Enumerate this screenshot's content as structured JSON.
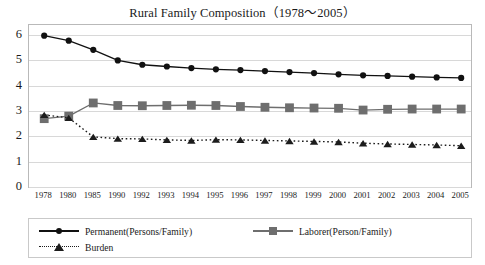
{
  "chart_data": {
    "type": "line",
    "title": "Rural Family Composition（1978～2005）",
    "xlabel": "",
    "ylabel": "",
    "ylim": [
      0,
      6.4
    ],
    "yticks": [
      0,
      1,
      2,
      3,
      4,
      5,
      6
    ],
    "grid": true,
    "legend_position": "bottom",
    "categories": [
      "1978",
      "1980",
      "1985",
      "1990",
      "1992",
      "1993",
      "1994",
      "1995",
      "1996",
      "1997",
      "1998",
      "1999",
      "2000",
      "2001",
      "2002",
      "2003",
      "2004",
      "2005"
    ],
    "series": [
      {
        "name": "Permanent(Persons/Family)",
        "marker": "circle",
        "line": "solid",
        "color": "#111111",
        "values": [
          5.98,
          5.78,
          5.42,
          5.0,
          4.83,
          4.76,
          4.7,
          4.65,
          4.62,
          4.58,
          4.54,
          4.5,
          4.45,
          4.41,
          4.39,
          4.36,
          4.33,
          4.31
        ]
      },
      {
        "name": "Laborer(Person/Family)",
        "marker": "square",
        "line": "solid",
        "color": "#6e6e6e",
        "values": [
          2.7,
          2.8,
          3.32,
          3.22,
          3.21,
          3.22,
          3.23,
          3.22,
          3.18,
          3.15,
          3.13,
          3.12,
          3.11,
          3.04,
          3.07,
          3.08,
          3.08,
          3.08
        ]
      },
      {
        "name": "Burden",
        "marker": "triangle",
        "line": "dotted",
        "color": "#1c1c1c",
        "values": [
          2.85,
          2.73,
          1.98,
          1.91,
          1.9,
          1.86,
          1.84,
          1.87,
          1.86,
          1.84,
          1.82,
          1.8,
          1.78,
          1.73,
          1.7,
          1.68,
          1.66,
          1.63
        ]
      }
    ]
  },
  "legend": {
    "entries": [
      {
        "label": "Permanent(Persons/Family)"
      },
      {
        "label": "Laborer(Person/Family)"
      },
      {
        "label": "Burden"
      }
    ]
  }
}
